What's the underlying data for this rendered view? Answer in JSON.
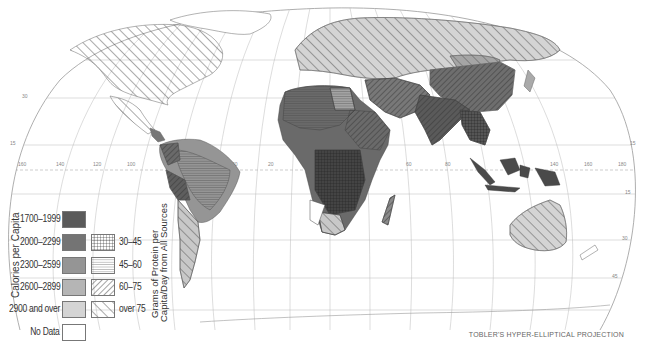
{
  "map": {
    "title": "Calories and Protein per Capita",
    "projection_label": "TOBLER'S HYPER-ELLIPTICAL PROJECTION",
    "longitude_labels": [
      "160",
      "140",
      "120",
      "100",
      "40",
      "20",
      "0",
      "60",
      "80",
      "140",
      "160",
      "180"
    ],
    "latitude_labels": [
      "30",
      "15",
      "15",
      "30",
      "45",
      "60"
    ]
  },
  "legend": {
    "calories_title": "Calories per Capita",
    "protein_title_line1": "Grams of Protein per",
    "protein_title_line2": "Capita/Day from All Sources",
    "calorie_classes": [
      {
        "label": "1700–1999",
        "color": "#5a5a5a"
      },
      {
        "label": "2000–2299",
        "color": "#747474"
      },
      {
        "label": "2300–2599",
        "color": "#959595"
      },
      {
        "label": "2600–2899",
        "color": "#b5b5b5"
      },
      {
        "label": "2900 and over",
        "color": "#d4d4d4"
      },
      {
        "label": "No Data",
        "color": "#ffffff"
      }
    ],
    "protein_classes": [
      {
        "label": "30–45",
        "pattern": "grid"
      },
      {
        "label": "45–60",
        "pattern": "horizontal-lines"
      },
      {
        "label": "60–75",
        "pattern": "dense-diagonal"
      },
      {
        "label": "over 75",
        "pattern": "sparse-diagonal"
      }
    ]
  }
}
